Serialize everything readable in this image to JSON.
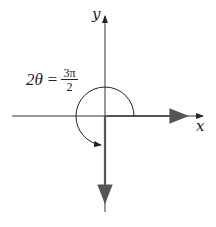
{
  "diagram": {
    "type": "angle-in-standard-position",
    "axes": {
      "x_label": "x",
      "y_label": "y"
    },
    "angle_label": {
      "lhs": "2θ",
      "equals": "=",
      "numerator": "3π",
      "denominator": "2"
    },
    "angle_value": "3π/2",
    "initial_side": "positive x-axis",
    "terminal_side": "negative y-axis",
    "colors": {
      "line": "#333333",
      "ray": "#555555",
      "background": "#ffffff"
    }
  }
}
